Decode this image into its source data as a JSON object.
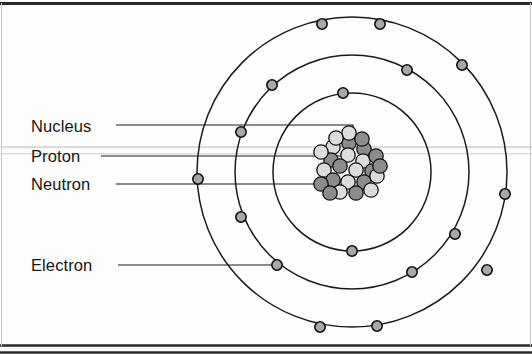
{
  "figure": {
    "width": 532,
    "height": 354,
    "background_color": "#fdfdfd",
    "border_color": "#2a2a2a"
  },
  "labels": {
    "nucleus": "Nucleus",
    "proton": "Proton",
    "neutron": "Neutron",
    "electron": "Electron"
  },
  "colors": {
    "proton": "#8c8c8c",
    "neutron": "#dcdcdc",
    "electron": "#a8a8a8",
    "orbit_stroke": "#1b1b1b",
    "outline": "#121212"
  },
  "chart_data": {
    "type": "diagram",
    "subtitle": "",
    "xlabel": "",
    "ylabel": "",
    "center": {
      "x": 352,
      "y": 172
    },
    "shells": [
      {
        "name": "inner shell",
        "radius": 79,
        "electron_count": 3
      },
      {
        "name": "middle shell",
        "radius": 117,
        "electron_count": 8
      },
      {
        "name": "outer shell",
        "radius": 155,
        "electron_count": 7
      }
    ],
    "electrons": [
      {
        "shell": 0,
        "x": 343,
        "y": 93
      },
      {
        "shell": 0,
        "x": 412,
        "y": 272
      },
      {
        "shell": 0,
        "x": 352,
        "y": 251
      },
      {
        "shell": 1,
        "x": 272,
        "y": 85
      },
      {
        "shell": 1,
        "x": 407,
        "y": 70
      },
      {
        "shell": 1,
        "x": 241,
        "y": 132
      },
      {
        "shell": 1,
        "x": 455,
        "y": 234
      },
      {
        "shell": 1,
        "x": 241,
        "y": 217
      },
      {
        "shell": 1,
        "x": 277,
        "y": 265
      },
      {
        "shell": 2,
        "x": 322,
        "y": 24
      },
      {
        "shell": 2,
        "x": 380,
        "y": 24
      },
      {
        "shell": 2,
        "x": 198,
        "y": 179
      },
      {
        "shell": 2,
        "x": 462,
        "y": 65
      },
      {
        "shell": 2,
        "x": 505,
        "y": 194
      },
      {
        "shell": 2,
        "x": 320,
        "y": 327
      },
      {
        "shell": 2,
        "x": 377,
        "y": 326
      },
      {
        "shell": 2,
        "x": 487,
        "y": 270
      }
    ],
    "nucleus": {
      "center": {
        "x": 349,
        "y": 168
      },
      "radius": 29,
      "particle_radius": 7.2,
      "proton_count": 13,
      "neutron_count": 12,
      "particles": [
        {
          "type": "proton",
          "x": 349,
          "y": 143
        },
        {
          "type": "neutron",
          "x": 333,
          "y": 147
        },
        {
          "type": "proton",
          "x": 364,
          "y": 149
        },
        {
          "type": "neutron",
          "x": 348,
          "y": 155
        },
        {
          "type": "proton",
          "x": 331,
          "y": 160
        },
        {
          "type": "neutron",
          "x": 363,
          "y": 161
        },
        {
          "type": "proton",
          "x": 376,
          "y": 156
        },
        {
          "type": "neutron",
          "x": 321,
          "y": 152
        },
        {
          "type": "proton",
          "x": 340,
          "y": 166
        },
        {
          "type": "neutron",
          "x": 356,
          "y": 170
        },
        {
          "type": "proton",
          "x": 372,
          "y": 171
        },
        {
          "type": "neutron",
          "x": 324,
          "y": 170
        },
        {
          "type": "proton",
          "x": 333,
          "y": 180
        },
        {
          "type": "neutron",
          "x": 348,
          "y": 182
        },
        {
          "type": "proton",
          "x": 364,
          "y": 182
        },
        {
          "type": "neutron",
          "x": 377,
          "y": 176
        },
        {
          "type": "proton",
          "x": 321,
          "y": 184
        },
        {
          "type": "neutron",
          "x": 340,
          "y": 192
        },
        {
          "type": "proton",
          "x": 356,
          "y": 193
        },
        {
          "type": "neutron",
          "x": 371,
          "y": 190
        },
        {
          "type": "proton",
          "x": 330,
          "y": 193
        },
        {
          "type": "neutron",
          "x": 349,
          "y": 133
        },
        {
          "type": "proton",
          "x": 362,
          "y": 139
        },
        {
          "type": "neutron",
          "x": 336,
          "y": 138
        },
        {
          "type": "proton",
          "x": 380,
          "y": 166
        }
      ]
    },
    "callouts": [
      {
        "target": "nucleus",
        "label_anchor": {
          "x": 116,
          "y": 125
        },
        "path": "M116,125 L353,125 L353,150"
      },
      {
        "target": "proton",
        "label_anchor": {
          "x": 101,
          "y": 156
        },
        "path": "M101,156 L345,156"
      },
      {
        "target": "neutron",
        "label_anchor": {
          "x": 116,
          "y": 184
        },
        "path": "M116,184 L340,184"
      },
      {
        "target": "electron",
        "label_anchor": {
          "x": 118,
          "y": 265
        },
        "path": "M118,265 L276,265"
      }
    ],
    "grid": false,
    "legend": "none"
  }
}
